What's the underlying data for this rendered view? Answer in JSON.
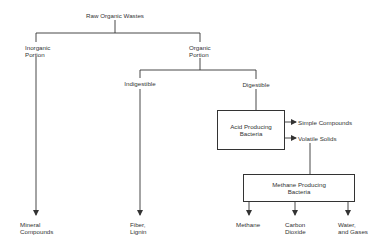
{
  "diagram": {
    "type": "flowchart",
    "title": "Raw Organic Wastes",
    "nodes": {
      "root": "Raw Organic Wastes",
      "inorganic": "Inorganic\nPortion",
      "organic": "Organic\nPortion",
      "indigestible": "Indigestible",
      "digestible": "Digestible",
      "acid_box": "Acid Producing\nBacteria",
      "simple_compounds": "Simple Compounds",
      "volatile_solids": "Volatile Solids",
      "methane_box": "Methane Producing\nBacteria",
      "mineral_compounds": "Mineral\nCompounds",
      "fiber_lignin": "Fiber,\nLignin",
      "methane": "Methane",
      "carbon_dioxide": "Carbon\nDioxide",
      "water_gases": "Water,\nand Gases"
    },
    "edges": [
      [
        "Raw Organic Wastes",
        "Inorganic Portion"
      ],
      [
        "Raw Organic Wastes",
        "Organic Portion"
      ],
      [
        "Inorganic Portion",
        "Mineral Compounds"
      ],
      [
        "Organic Portion",
        "Indigestible"
      ],
      [
        "Organic Portion",
        "Digestible"
      ],
      [
        "Indigestible",
        "Fiber, Lignin"
      ],
      [
        "Digestible",
        "Acid Producing Bacteria"
      ],
      [
        "Acid Producing Bacteria",
        "Simple Compounds"
      ],
      [
        "Acid Producing Bacteria",
        "Volatile Solids"
      ],
      [
        "Volatile Solids",
        "Methane Producing Bacteria"
      ],
      [
        "Methane Producing Bacteria",
        "Methane"
      ],
      [
        "Methane Producing Bacteria",
        "Carbon Dioxide"
      ],
      [
        "Methane Producing Bacteria",
        "Water, and Gases"
      ]
    ],
    "colors": {
      "line": "#333333",
      "background": "#ffffff"
    }
  }
}
